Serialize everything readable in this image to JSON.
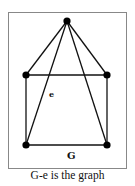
{
  "figure": {
    "frame": {
      "x": 8,
      "y": 12,
      "width": 118,
      "height": 156,
      "stroke": "#888888"
    },
    "vertices": [
      {
        "id": "top",
        "x": 67,
        "y": 21
      },
      {
        "id": "mid-left",
        "x": 26,
        "y": 75
      },
      {
        "id": "mid-right",
        "x": 107,
        "y": 75
      },
      {
        "id": "bottom-left",
        "x": 26,
        "y": 145
      },
      {
        "id": "bottom-right",
        "x": 107,
        "y": 145
      }
    ],
    "edges": [
      [
        "top",
        "mid-left"
      ],
      [
        "top",
        "mid-right"
      ],
      [
        "top",
        "bottom-left"
      ],
      [
        "top",
        "bottom-right"
      ],
      [
        "mid-left",
        "mid-right"
      ],
      [
        "mid-left",
        "bottom-left"
      ],
      [
        "mid-right",
        "bottom-right"
      ],
      [
        "bottom-left",
        "bottom-right"
      ]
    ],
    "labels": [
      {
        "text": "e",
        "x": 49,
        "y": 97
      },
      {
        "text": "G",
        "x": 67,
        "y": 159
      }
    ],
    "colors": {
      "edge": "#111111",
      "vertex": "#000000"
    }
  },
  "caption": "G-e is the graph"
}
